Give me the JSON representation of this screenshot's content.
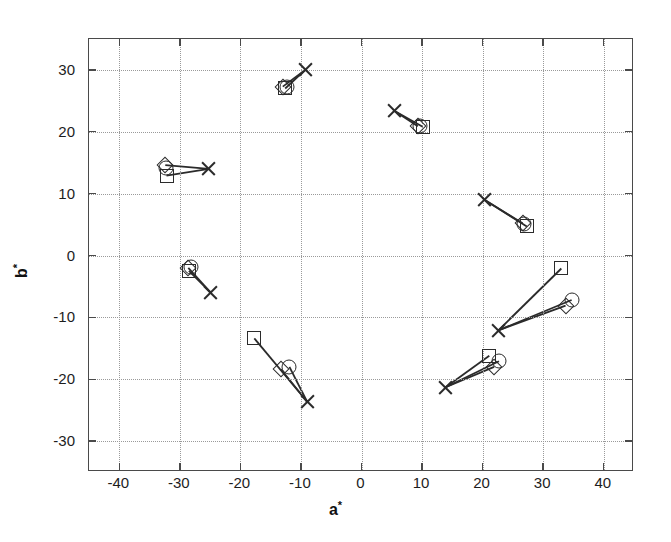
{
  "chart_data": {
    "type": "scatter",
    "title": "",
    "xlabel": "a*",
    "ylabel": "b*",
    "xlim": [
      -45,
      45
    ],
    "ylim": [
      -35,
      35
    ],
    "xticks": [
      -40,
      -30,
      -20,
      -10,
      0,
      10,
      20,
      30,
      40
    ],
    "yticks": [
      30,
      20,
      10,
      0,
      -10,
      -20,
      -30
    ],
    "xtick_labels": [
      "-40",
      "-30",
      "-20",
      "-10",
      "0",
      "10",
      "20",
      "30",
      "40"
    ],
    "ytick_labels": [
      "30",
      "20",
      "10",
      "0",
      "-10",
      "-20",
      "-30"
    ],
    "grid": true,
    "legend": "none",
    "marker_types": [
      "x",
      "circle",
      "square",
      "diamond"
    ],
    "series": [
      {
        "name": "reference-x",
        "marker": "x",
        "points": [
          {
            "a": -9.3,
            "b": 30.0
          },
          {
            "a": 5.4,
            "b": 23.4
          },
          {
            "a": -25.2,
            "b": 14.0
          },
          {
            "a": 20.3,
            "b": 9.0
          },
          {
            "a": -24.9,
            "b": -6.0
          },
          {
            "a": 22.6,
            "b": -12.1
          },
          {
            "a": -9.0,
            "b": -23.6
          },
          {
            "a": 13.9,
            "b": -21.3
          }
        ]
      },
      {
        "name": "estimate-circle",
        "marker": "circle",
        "points": [
          {
            "a": -12.3,
            "b": 27.2
          },
          {
            "a": 9.6,
            "b": 20.9
          },
          {
            "a": -32.3,
            "b": 14.2
          },
          {
            "a": 26.8,
            "b": 5.1
          },
          {
            "a": -28.2,
            "b": -1.9
          },
          {
            "a": 34.7,
            "b": -7.2
          },
          {
            "a": -11.9,
            "b": -18.0
          },
          {
            "a": 22.7,
            "b": -17.1
          }
        ]
      },
      {
        "name": "estimate-square",
        "marker": "square",
        "points": [
          {
            "a": -12.6,
            "b": 27.0
          },
          {
            "a": 10.1,
            "b": 20.8
          },
          {
            "a": -32.2,
            "b": 12.9
          },
          {
            "a": 27.3,
            "b": 4.7
          },
          {
            "a": -28.5,
            "b": -2.5
          },
          {
            "a": 33.0,
            "b": -2.1
          },
          {
            "a": -17.7,
            "b": -13.4
          },
          {
            "a": 21.1,
            "b": -16.2
          }
        ]
      },
      {
        "name": "estimate-diamond",
        "marker": "diamond",
        "points": [
          {
            "a": -13.0,
            "b": 27.3
          },
          {
            "a": 9.3,
            "b": 20.9
          },
          {
            "a": -32.4,
            "b": 14.6
          },
          {
            "a": 26.6,
            "b": 5.2
          },
          {
            "a": -28.6,
            "b": -2.0
          },
          {
            "a": 33.7,
            "b": -8.1
          },
          {
            "a": -13.3,
            "b": -18.4
          },
          {
            "a": 21.9,
            "b": -18.0
          }
        ]
      }
    ],
    "connectors": [
      {
        "from": {
          "a": -9.3,
          "b": 30.0
        },
        "to": {
          "a": -12.6,
          "b": 27.0
        }
      },
      {
        "from": {
          "a": -9.3,
          "b": 30.0
        },
        "to": {
          "a": -13.0,
          "b": 27.3
        }
      },
      {
        "from": {
          "a": 5.4,
          "b": 23.4
        },
        "to": {
          "a": 10.1,
          "b": 20.8
        }
      },
      {
        "from": {
          "a": 5.4,
          "b": 23.4
        },
        "to": {
          "a": 9.3,
          "b": 20.9
        }
      },
      {
        "from": {
          "a": -25.2,
          "b": 14.0
        },
        "to": {
          "a": -32.2,
          "b": 12.9
        }
      },
      {
        "from": {
          "a": -25.2,
          "b": 14.0
        },
        "to": {
          "a": -32.4,
          "b": 14.6
        }
      },
      {
        "from": {
          "a": 20.3,
          "b": 9.0
        },
        "to": {
          "a": 27.3,
          "b": 4.7
        }
      },
      {
        "from": {
          "a": 20.3,
          "b": 9.0
        },
        "to": {
          "a": 26.6,
          "b": 5.2
        }
      },
      {
        "from": {
          "a": -24.9,
          "b": -6.0
        },
        "to": {
          "a": -28.5,
          "b": -2.5
        }
      },
      {
        "from": {
          "a": -24.9,
          "b": -6.0
        },
        "to": {
          "a": -28.6,
          "b": -2.0
        }
      },
      {
        "from": {
          "a": 22.6,
          "b": -12.1
        },
        "to": {
          "a": 33.0,
          "b": -2.1
        }
      },
      {
        "from": {
          "a": 22.6,
          "b": -12.1
        },
        "to": {
          "a": 34.7,
          "b": -7.2
        }
      },
      {
        "from": {
          "a": 22.6,
          "b": -12.1
        },
        "to": {
          "a": 33.7,
          "b": -8.1
        }
      },
      {
        "from": {
          "a": -9.0,
          "b": -23.6
        },
        "to": {
          "a": -17.7,
          "b": -13.4
        }
      },
      {
        "from": {
          "a": -9.0,
          "b": -23.6
        },
        "to": {
          "a": -13.3,
          "b": -18.4
        }
      },
      {
        "from": {
          "a": -9.0,
          "b": -23.6
        },
        "to": {
          "a": -11.9,
          "b": -18.0
        }
      },
      {
        "from": {
          "a": 13.9,
          "b": -21.3
        },
        "to": {
          "a": 21.1,
          "b": -16.2
        }
      },
      {
        "from": {
          "a": 13.9,
          "b": -21.3
        },
        "to": {
          "a": 21.9,
          "b": -18.0
        }
      },
      {
        "from": {
          "a": 13.9,
          "b": -21.3
        },
        "to": {
          "a": 22.7,
          "b": -17.1
        }
      }
    ]
  },
  "axes": {
    "x_title_base": "a",
    "x_title_star": "*",
    "y_title_base": "b",
    "y_title_star": "*"
  }
}
